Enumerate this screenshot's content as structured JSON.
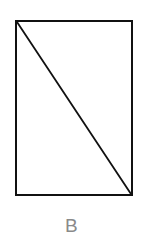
{
  "figure": {
    "label": "B",
    "label_color": "#8a8a8a",
    "background_color": "#ffffff",
    "stroke_color": "#111111",
    "shape": {
      "name": "rectangle-with-diagonal",
      "rect": {
        "x": 15,
        "y": 20,
        "width": 118,
        "height": 176,
        "border_width": 2
      },
      "diagonal": {
        "from": "top-left",
        "to": "bottom-right",
        "x1": 16,
        "y1": 21,
        "x2": 132,
        "y2": 195,
        "stroke_width": 1.8
      }
    }
  }
}
